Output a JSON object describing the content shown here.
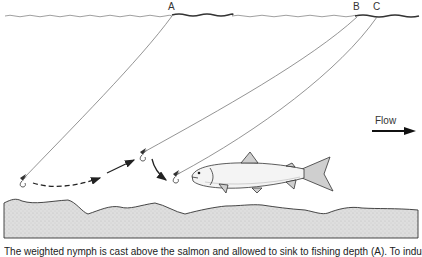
{
  "diagram": {
    "labels": {
      "a": "A",
      "b": "B",
      "c": "C"
    },
    "flow": {
      "label": "Flow",
      "direction": "right"
    },
    "caption": "The weighted nymph is cast above the salmon and allowed to sink to fishing depth (A). To induce",
    "elements": {
      "water_surface": "wavy surface line",
      "riverbed": "stippled gravel bottom",
      "fish": "salmon facing left",
      "flies": [
        "fly at position A",
        "fly at position B",
        "fly at position C"
      ],
      "motion_arrows": [
        "dashed arrow A to B",
        "solid arrow toward B",
        "curved arrow B to C"
      ]
    },
    "colors": {
      "line": "#555555",
      "ink": "#222222",
      "gravel": "#d9d9d9"
    }
  }
}
